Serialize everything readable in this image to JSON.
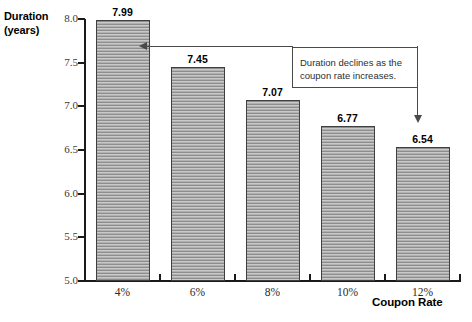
{
  "chart_data": {
    "type": "bar",
    "title": "",
    "xlabel": "Coupon Rate",
    "ylabel_line1": "Duration",
    "ylabel_line2": "(years)",
    "categories": [
      "4%",
      "6%",
      "8%",
      "10%",
      "12%"
    ],
    "values": [
      7.99,
      7.45,
      7.07,
      6.77,
      6.54
    ],
    "value_labels": [
      "7.99",
      "7.45",
      "7.07",
      "6.77",
      "6.54"
    ],
    "ylim": [
      5.0,
      8.0
    ],
    "y_ticks": [
      8.0,
      7.5,
      7.0,
      6.5,
      6.0,
      5.5,
      5.0
    ],
    "y_tick_labels": [
      "8.0",
      "7.5",
      "7.0",
      "6.5",
      "6.0",
      "5.5",
      "5.0"
    ],
    "grid": false,
    "legend": false,
    "annotations": [
      {
        "line1": "Duration declines as the",
        "line2": "coupon rate increases.",
        "points_to": [
          "4%",
          "12%"
        ]
      }
    ],
    "colors": {
      "bar_fill": "#b4b4b4",
      "bar_stripe_dark": "#8d8d8d",
      "bar_stripe_light": "#c9c9c9",
      "bar_border": "#3f3f3f",
      "axis": "#1a1a1a",
      "annotation_border": "#4a4a4a",
      "text": "#000000",
      "background": "#ffffff"
    }
  }
}
